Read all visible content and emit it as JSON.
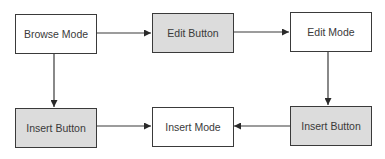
{
  "diagram": {
    "type": "flowchart",
    "colors": {
      "state_fill": "#ffffff",
      "action_fill": "#dcdcdc",
      "stroke": "#3a3a3a",
      "text": "#3a3a3a"
    },
    "nodes": [
      {
        "id": "browse_mode",
        "label": "Browse Mode",
        "kind": "state"
      },
      {
        "id": "edit_button",
        "label": "Edit Button",
        "kind": "action"
      },
      {
        "id": "edit_mode",
        "label": "Edit Mode",
        "kind": "state"
      },
      {
        "id": "insert_button_left",
        "label": "Insert Button",
        "kind": "action"
      },
      {
        "id": "insert_mode",
        "label": "Insert Mode",
        "kind": "state"
      },
      {
        "id": "insert_button_right",
        "label": "Insert Button",
        "kind": "action"
      }
    ],
    "edges": [
      {
        "from": "browse_mode",
        "to": "edit_button"
      },
      {
        "from": "edit_button",
        "to": "edit_mode"
      },
      {
        "from": "edit_mode",
        "to": "insert_button_right"
      },
      {
        "from": "insert_button_right",
        "to": "insert_mode"
      },
      {
        "from": "browse_mode",
        "to": "insert_button_left"
      },
      {
        "from": "insert_button_left",
        "to": "insert_mode"
      }
    ]
  }
}
